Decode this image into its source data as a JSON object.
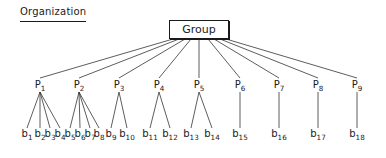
{
  "title": "Organization",
  "root": {
    "label": "Group"
  },
  "processes": [
    {
      "label": "P",
      "sub": "1",
      "children": [
        {
          "label": "b",
          "sub": "1"
        },
        {
          "label": "b",
          "sub": "2"
        },
        {
          "label": "b",
          "sub": "3"
        },
        {
          "label": "b",
          "sub": "4"
        }
      ]
    },
    {
      "label": "P",
      "sub": "2",
      "children": [
        {
          "label": "b",
          "sub": "5"
        },
        {
          "label": "b",
          "sub": "6"
        },
        {
          "label": "b",
          "sub": "7"
        },
        {
          "label": "b",
          "sub": "8"
        }
      ]
    },
    {
      "label": "P",
      "sub": "3",
      "children": [
        {
          "label": "b",
          "sub": "9"
        },
        {
          "label": "b",
          "sub": "10"
        }
      ]
    },
    {
      "label": "P",
      "sub": "4",
      "children": [
        {
          "label": "b",
          "sub": "11"
        },
        {
          "label": "b",
          "sub": "12"
        }
      ]
    },
    {
      "label": "P",
      "sub": "5",
      "children": [
        {
          "label": "b",
          "sub": "13"
        },
        {
          "label": "b",
          "sub": "14"
        }
      ]
    },
    {
      "label": "P",
      "sub": "6",
      "children": [
        {
          "label": "b",
          "sub": "15"
        }
      ]
    },
    {
      "label": "P",
      "sub": "7",
      "children": [
        {
          "label": "b",
          "sub": "16"
        }
      ]
    },
    {
      "label": "P",
      "sub": "8",
      "children": [
        {
          "label": "b",
          "sub": "17"
        }
      ]
    },
    {
      "label": "P",
      "sub": "9",
      "children": [
        {
          "label": "b",
          "sub": "18"
        }
      ]
    }
  ]
}
